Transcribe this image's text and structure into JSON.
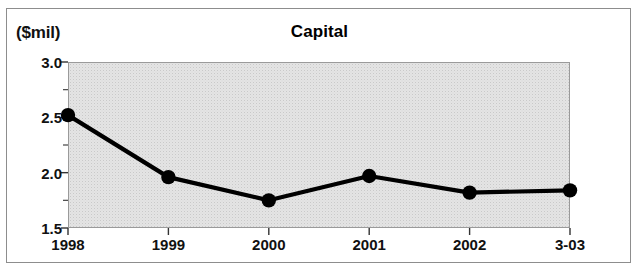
{
  "figure": {
    "unit_label": "($mil)",
    "title": "Capital"
  },
  "chart_data": {
    "type": "line",
    "title": "Capital",
    "subtitle": "",
    "xlabel": "",
    "ylabel": "($mil)",
    "unit": "$mil",
    "categories": [
      "1998",
      "1999",
      "2000",
      "2001",
      "2002",
      "3-03"
    ],
    "values": [
      2.52,
      1.96,
      1.75,
      1.97,
      1.82,
      1.84
    ],
    "series": [
      {
        "name": "Capital",
        "values": [
          2.52,
          1.96,
          1.75,
          1.97,
          1.82,
          1.84
        ]
      }
    ],
    "ylim": [
      1.5,
      3.0
    ],
    "ytick_labels": [
      "3.0",
      "2.5",
      "2.0",
      "1.5"
    ],
    "ytick_values": [
      3.0,
      2.5,
      2.0,
      1.5
    ],
    "yminor_values": [
      2.75,
      2.25,
      1.75
    ],
    "ytick_interval": 0.5,
    "yminor_interval": 0.25,
    "xtick_labels": [
      "1998",
      "1999",
      "2000",
      "2001",
      "2002",
      "3-03"
    ],
    "grid": false,
    "legend": false,
    "legend_position": "none",
    "marker": "circle",
    "marker_color": "#000000",
    "line_color": "#000000",
    "plot_background": "#e4e4e4",
    "annotations": []
  }
}
